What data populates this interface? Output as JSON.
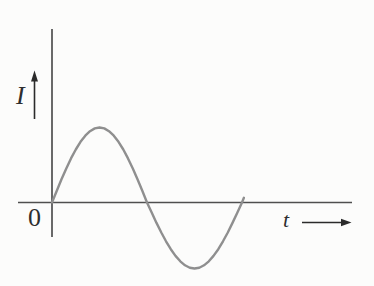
{
  "figure": {
    "background_color": "#fcfcfb",
    "labels": {
      "y_axis": "I",
      "x_axis": "t",
      "origin": "0"
    },
    "colors": {
      "axis": "#4f4f4f",
      "curve": "#8f8f8f",
      "arrow": "#2b2b2b",
      "text": "#2e2e2e"
    }
  },
  "chart_data": {
    "type": "line",
    "title": "",
    "xlabel": "t",
    "ylabel": "I",
    "origin_label": "0",
    "x_unit": "t / T (fraction of one period)",
    "y_unit": "I / I_peak (normalized amplitude)",
    "xlim": [
      0,
      1.01
    ],
    "ylim": [
      -1,
      1
    ],
    "grid": false,
    "legend": false,
    "x": [
      0,
      0.025,
      0.05,
      0.075,
      0.1,
      0.125,
      0.15,
      0.175,
      0.2,
      0.225,
      0.25,
      0.275,
      0.3,
      0.325,
      0.35,
      0.375,
      0.4,
      0.425,
      0.45,
      0.475,
      0.5,
      0.525,
      0.55,
      0.575,
      0.6,
      0.625,
      0.65,
      0.675,
      0.7,
      0.725,
      0.75,
      0.775,
      0.8,
      0.825,
      0.85,
      0.875,
      0.9,
      0.925,
      0.95,
      0.975,
      1.0,
      1.01
    ],
    "series": [
      {
        "name": "alternating current, one sine cycle",
        "values": [
          0,
          0.156,
          0.309,
          0.454,
          0.588,
          0.707,
          0.809,
          0.891,
          0.951,
          0.988,
          1,
          0.988,
          0.951,
          0.891,
          0.809,
          0.707,
          0.588,
          0.454,
          0.309,
          0.156,
          0,
          -0.156,
          -0.309,
          -0.454,
          -0.588,
          -0.707,
          -0.809,
          -0.891,
          -0.951,
          -0.988,
          -1,
          -0.988,
          -0.951,
          -0.891,
          -0.809,
          -0.707,
          -0.588,
          -0.454,
          -0.309,
          -0.156,
          0,
          0.063
        ]
      }
    ],
    "render": {
      "origin_px": [
        52,
        202.5
      ],
      "period_px": 190,
      "amplitude_top_px": 75,
      "amplitude_bottom_px": 66
    }
  }
}
